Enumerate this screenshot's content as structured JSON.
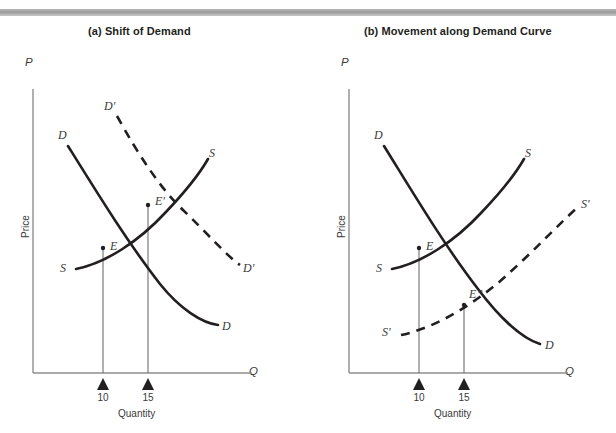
{
  "figure": {
    "top_rule_color": "#9b9b9b",
    "ink_color": "#231f20",
    "axis_color": "#8e8e8e"
  },
  "panels": [
    {
      "id": "a",
      "title": "(a) Shift of Demand",
      "axes": {
        "y_symbol": "P",
        "y_label": "Price",
        "x_symbol": "Q",
        "x_label": "Quantity"
      },
      "ticks": [
        {
          "value": "10"
        },
        {
          "value": "15"
        }
      ],
      "curve_labels": [
        {
          "name": "demand-upper-label",
          "text": "D"
        },
        {
          "name": "demand-shifted-upper-label",
          "text": "D'"
        },
        {
          "name": "supply-upper-label",
          "text": "S"
        },
        {
          "name": "supply-lower-label",
          "text": "S"
        },
        {
          "name": "demand-lower-label",
          "text": "D"
        },
        {
          "name": "demand-shifted-lower-label",
          "text": "D'"
        }
      ],
      "equilibria": [
        {
          "name": "equilibrium-e",
          "text": "E"
        },
        {
          "name": "equilibrium-e-prime",
          "text": "E'"
        }
      ]
    },
    {
      "id": "b",
      "title": "(b) Movement along Demand Curve",
      "axes": {
        "y_symbol": "P",
        "y_label": "Price",
        "x_symbol": "Q",
        "x_label": "Quantity"
      },
      "ticks": [
        {
          "value": "10"
        },
        {
          "value": "15"
        }
      ],
      "curve_labels": [
        {
          "name": "demand-upper-label",
          "text": "D"
        },
        {
          "name": "supply-upper-label",
          "text": "S"
        },
        {
          "name": "supply-shifted-upper-label",
          "text": "S'"
        },
        {
          "name": "supply-lower-label",
          "text": "S"
        },
        {
          "name": "supply-shifted-lower-label",
          "text": "S'"
        },
        {
          "name": "demand-lower-label",
          "text": "D"
        }
      ],
      "equilibria": [
        {
          "name": "equilibrium-e",
          "text": "E"
        },
        {
          "name": "equilibrium-e-double-prime",
          "text": "E”"
        }
      ]
    }
  ]
}
